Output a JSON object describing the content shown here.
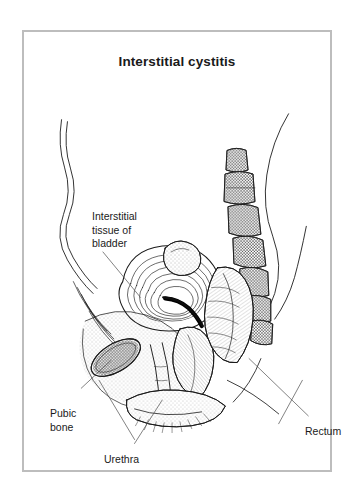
{
  "figure": {
    "title": "Interstitial cystitis",
    "border_color": "#bdbdbd",
    "background_color": "#ffffff",
    "ink_color": "#1a1a1a"
  },
  "labels": [
    {
      "id": "interstitial-tissue-of-bladder",
      "text": "Interstitial\ntissue of\nbladder"
    },
    {
      "id": "pubic-bone",
      "text": "Pubic\nbone"
    },
    {
      "id": "urethra",
      "text": "Urethra"
    },
    {
      "id": "rectum",
      "text": "Rectum"
    }
  ],
  "diagram": {
    "type": "medical-line-illustration",
    "view": "female pelvis, midsagittal section",
    "structures": [
      "abdominal wall",
      "back contour",
      "sacrum and coccyx vertebrae",
      "urinary bladder with thickened interstitial wall",
      "bladder lumen",
      "urethra",
      "pubic bone",
      "vagina",
      "rectum",
      "perineum"
    ]
  }
}
